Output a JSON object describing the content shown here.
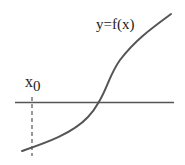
{
  "diagram": {
    "function_label": "y=f(x)",
    "point_label_base": "x",
    "point_label_sub": "0",
    "colors": {
      "axis": "#555555",
      "curve": "#555555",
      "dashed": "#555555",
      "text": "#222222"
    }
  }
}
